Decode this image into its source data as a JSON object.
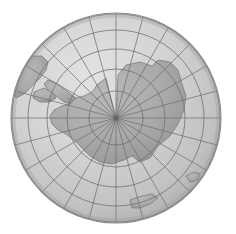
{
  "figure": {
    "projection": "orthographic",
    "background_color": "#ffffff",
    "width": 236,
    "height": 234
  },
  "globe": {
    "center_x": 116,
    "center_y": 118,
    "radius": 105,
    "ocean_color": "#d3d3d3",
    "land_color": "#a9a9a9",
    "outline_color": "#8c8c8c",
    "graticule_color": "#6e6e6e",
    "shadow_color": "#9a9a9a",
    "highlight_color": "#e6e6e6",
    "pole_marker_color": "#5a5a5a"
  },
  "projection_center": {
    "latitude": -90,
    "longitude": 0,
    "label": "South Pole"
  },
  "graticule": {
    "meridian_spacing_degrees": 15,
    "meridian_count": 24,
    "parallel_spacing_degrees": 15,
    "parallel_labels": [
      "-15",
      "-30",
      "-45",
      "-60",
      "-75"
    ],
    "parallel_radii": [
      105,
      88,
      69,
      49,
      27
    ],
    "limb_visible": true,
    "grid_on": true
  },
  "features": [
    {
      "name": "Antarctica",
      "type": "continent",
      "visible": true
    },
    {
      "name": "Antarctic Peninsula",
      "type": "peninsula",
      "visible": true
    },
    {
      "name": "Southern South America",
      "type": "continent-tip",
      "visible": true
    },
    {
      "name": "New Zealand South Island",
      "type": "island",
      "visible": true
    },
    {
      "name": "Tasmania",
      "type": "island",
      "visible": true
    }
  ],
  "polygons": {
    "antarctica": "M 116,119 L 118,75 L 126,65 L 140,62 L 152,66 L 158,60 L 170,62 L 178,70 L 182,84 L 186,96 L 184,110 L 178,124 L 170,136 L 158,146 L 150,158 L 140,162 L 132,156 L 124,160 L 112,164 L 100,162 L 90,156 L 82,148 L 74,140 L 66,134 L 58,130 L 52,124 L 50,116 L 54,110 L 62,106 L 70,104 L 76,98 L 84,96 L 92,92 L 98,84 L 106,78 Z",
    "antarctic_peninsula": "M 76,98 L 68,92 L 60,86 L 54,82 L 48,80 L 44,84 L 48,90 L 56,96 L 64,102 L 70,104 Z",
    "south_america_tip": "M 14,72 L 22,62 L 32,56 L 42,56 L 48,62 L 46,70 L 40,78 L 32,86 L 24,94 L 16,98 L 12,92 Z",
    "south_america_fragment": "M 34,92 L 44,88 L 52,92 L 56,98 L 50,102 L 40,102 L 33,98 Z",
    "island_nz": "M 130,200 L 142,196 L 152,194 L 158,198 L 150,204 L 140,208 L 132,208 Z",
    "island_tasmania": "M 186,176 L 194,172 L 200,174 L 198,180 L 190,182 Z"
  },
  "chart_data": {
    "type": "map",
    "projection": "orthographic",
    "center": [
      0,
      -90
    ],
    "graticule_step": 15,
    "grid": true,
    "legend": "none"
  }
}
